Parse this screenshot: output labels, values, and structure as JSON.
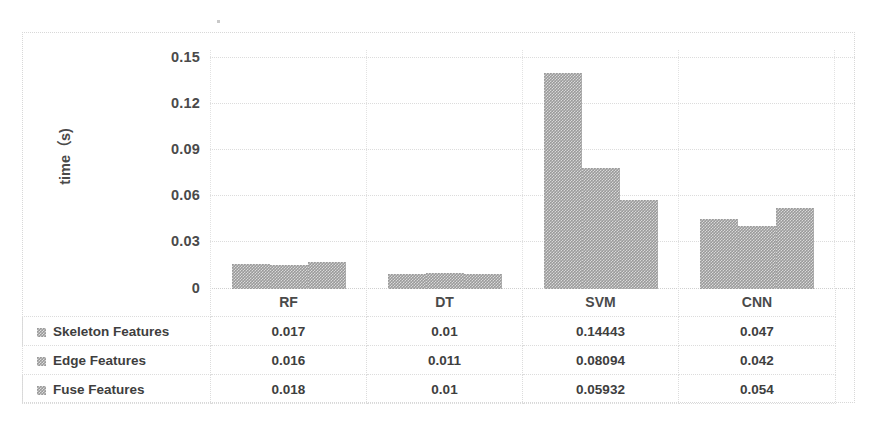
{
  "chart_data": {
    "type": "bar",
    "title": "",
    "subtitle": "",
    "xlabel": "",
    "ylabel": "time（s)",
    "categories": [
      "RF",
      "DT",
      "SVM",
      "CNN"
    ],
    "series": [
      {
        "name": "Skeleton Features",
        "values": [
          0.017,
          0.01,
          0.14443,
          0.047
        ]
      },
      {
        "name": "Edge Features",
        "values": [
          0.016,
          0.011,
          0.08094,
          0.042
        ]
      },
      {
        "name": "Fuse Features",
        "values": [
          0.018,
          0.01,
          0.05932,
          0.054
        ]
      }
    ],
    "y_ticks": [
      "0.15",
      "0.12",
      "0.09",
      "0.06",
      "0.03",
      "0"
    ],
    "y_tick_values": [
      0.15,
      0.12,
      0.09,
      0.06,
      0.03,
      0
    ],
    "ylim": [
      0,
      0.159
    ],
    "grid": true,
    "legend_position": "data-table-left",
    "has_data_table": true,
    "bar_color": "#9a9a9a",
    "grid_color": "#dcdcdc"
  },
  "table": {
    "row_header_values": [
      "",
      "RF",
      "DT",
      "SVM",
      "CNN"
    ],
    "rows": [
      {
        "label": "Skeleton Features",
        "cells": [
          "0.017",
          "0.01",
          "0.14443",
          "0.047"
        ]
      },
      {
        "label": "Edge Features",
        "cells": [
          "0.016",
          "0.011",
          "0.08094",
          "0.042"
        ]
      },
      {
        "label": "Fuse Features",
        "cells": [
          "0.018",
          "0.01",
          "0.05932",
          "0.054"
        ]
      }
    ]
  },
  "axis": {
    "y_title": "time（s)",
    "ticks": [
      {
        "label": "0.15"
      },
      {
        "label": "0.12"
      },
      {
        "label": "0.09"
      },
      {
        "label": "0.06"
      },
      {
        "label": "0.03"
      },
      {
        "label": "0"
      }
    ]
  }
}
